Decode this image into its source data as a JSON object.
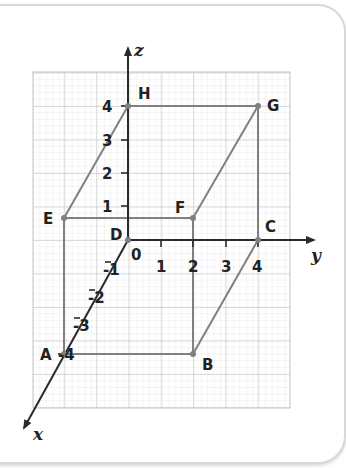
{
  "diagram": {
    "type": "3d-coordinate-cuboid",
    "axes": {
      "x": {
        "label": "x",
        "ticks": [
          "-1",
          "-2",
          "-3",
          "-4"
        ]
      },
      "y": {
        "label": "y",
        "ticks": [
          "0",
          "1",
          "2",
          "3",
          "4"
        ]
      },
      "z": {
        "label": "z",
        "ticks": [
          "1",
          "2",
          "3",
          "4"
        ]
      }
    },
    "vertices": [
      {
        "name": "A",
        "label": "A"
      },
      {
        "name": "B",
        "label": "B"
      },
      {
        "name": "C",
        "label": "C"
      },
      {
        "name": "D",
        "label": "D"
      },
      {
        "name": "E",
        "label": "E"
      },
      {
        "name": "F",
        "label": "F"
      },
      {
        "name": "G",
        "label": "G"
      },
      {
        "name": "H",
        "label": "H"
      }
    ],
    "colors": {
      "edge": "#808080",
      "axis": "#2a2a2a",
      "grid_minor": "#d9d9d9",
      "grid_major": "#bdbdbd",
      "frame": "#d8d8d8"
    }
  }
}
